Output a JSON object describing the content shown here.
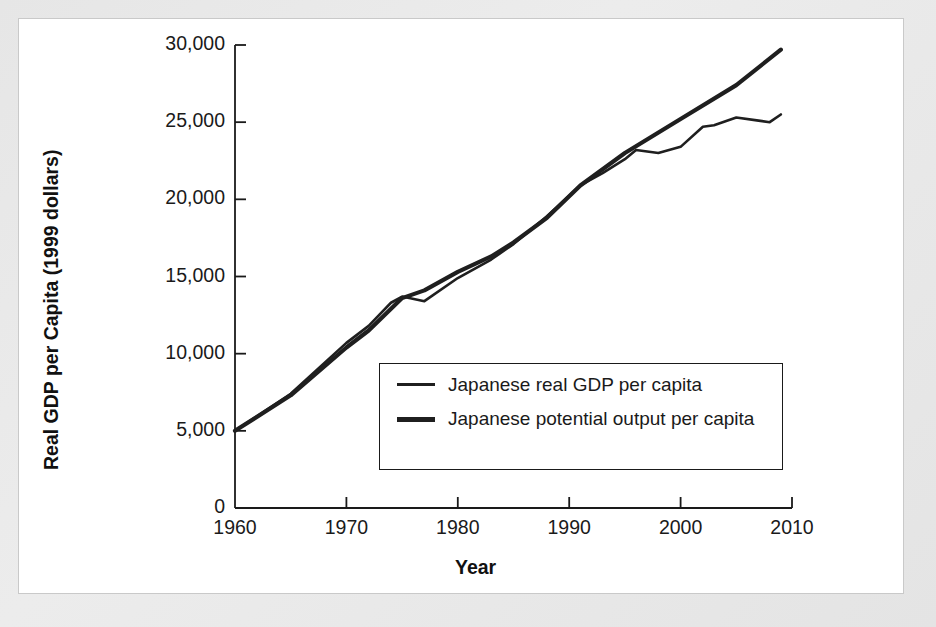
{
  "figure": {
    "panel_background": "#ffffff",
    "outer_background": "#e9e9e9",
    "line_color": "#1f1f1f"
  },
  "axes": {
    "y_title": "Real GDP per Capita (1999 dollars)",
    "x_title": "Year",
    "y_ticks": [
      "0",
      "5,000",
      "10,000",
      "15,000",
      "20,000",
      "25,000",
      "30,000"
    ],
    "x_ticks": [
      "1960",
      "1970",
      "1980",
      "1990",
      "2000",
      "2010"
    ]
  },
  "legend": {
    "items": [
      {
        "label": "Japanese real GDP per capita",
        "style": "thin"
      },
      {
        "label": "Japanese potential output per capita",
        "style": "thick"
      }
    ]
  },
  "chart_data": {
    "type": "line",
    "title": "",
    "xlabel": "Year",
    "ylabel": "Real GDP per Capita (1999 dollars)",
    "xlim": [
      1960,
      2010
    ],
    "ylim": [
      0,
      30000
    ],
    "grid": false,
    "legend_position": "inside-center-right",
    "x_tick_values": [
      1960,
      1970,
      1980,
      1990,
      2000,
      2010
    ],
    "y_tick_values": [
      0,
      5000,
      10000,
      15000,
      20000,
      25000,
      30000
    ],
    "series": [
      {
        "name": "Japanese real GDP per capita",
        "line_width": "thin",
        "color": "#1f1f1f",
        "x": [
          1960,
          1965,
          1970,
          1972,
          1974,
          1975,
          1977,
          1980,
          1983,
          1985,
          1988,
          1991,
          1993,
          1995,
          1996,
          1998,
          2000,
          2002,
          2003,
          2005,
          2007,
          2008,
          2009
        ],
        "values": [
          5000,
          7400,
          10700,
          11800,
          13300,
          13700,
          13400,
          14900,
          16100,
          17100,
          18900,
          20900,
          21700,
          22600,
          23200,
          23000,
          23400,
          24700,
          24800,
          25300,
          25100,
          25000,
          25500
        ]
      },
      {
        "name": "Japanese potential output per capita",
        "line_width": "thick",
        "color": "#1f1f1f",
        "x": [
          1960,
          1965,
          1970,
          1972,
          1975,
          1977,
          1980,
          1983,
          1985,
          1988,
          1991,
          1995,
          2000,
          2005,
          2009
        ],
        "values": [
          5000,
          7300,
          10400,
          11500,
          13600,
          14100,
          15300,
          16300,
          17200,
          18800,
          20900,
          23000,
          25200,
          27400,
          29700
        ]
      }
    ],
    "annotations": [
      "Real GDP dips below potential after the mid-1970s oil shock",
      "Real GDP falls markedly below potential output after 1991"
    ]
  }
}
